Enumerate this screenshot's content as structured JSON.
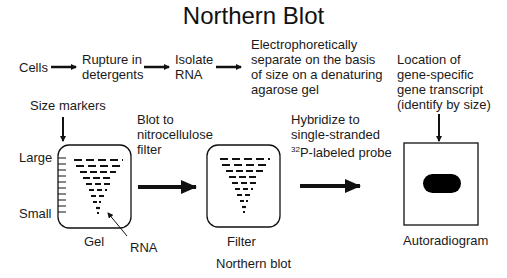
{
  "title": "Northern Blot",
  "steps": {
    "cells": "Cells",
    "rupture": "Rupture in\ndetergents",
    "isolate": "Isolate\nRNA",
    "electro": "Electrophoretically\nseparate on the basis\nof size on a denaturing\nagarose gel",
    "location": "Location of\ngene-specific\ngene transcript\n(identify by size)"
  },
  "size_markers": "Size markers",
  "blot": "Blot to\nnitrocellulose\nfilter",
  "hybridize_line1": "Hybridize to\nsingle-stranded",
  "probe_sup": "32",
  "probe_rest": "P-labeled probe",
  "labels": {
    "large": "Large",
    "small": "Small",
    "gel": "Gel",
    "rna": "RNA",
    "filter": "Filter",
    "northern_blot": "Northern blot",
    "autoradiogram": "Autoradiogram"
  },
  "colors": {
    "ink": "#111111",
    "background": "#ffffff"
  }
}
